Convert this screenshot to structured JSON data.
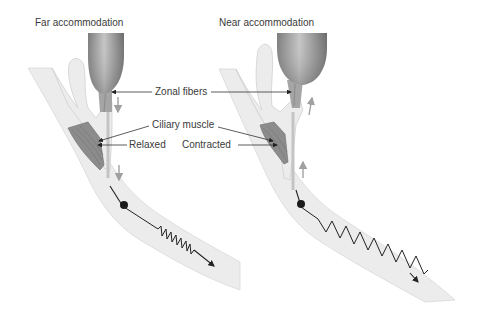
{
  "panels": {
    "far": {
      "title": "Far accommodation"
    },
    "near": {
      "title": "Near accommodation"
    }
  },
  "labels": {
    "zonal_fibers": "Zonal fibers",
    "ciliary_muscle": "Ciliary muscle",
    "relaxed": "Relaxed",
    "contracted": "Contracted"
  },
  "colors": {
    "background": "#ffffff",
    "tissue": "#ececec",
    "tissue_edge": "#d6d6d6",
    "lens_dark": "#6e6e6e",
    "lens_light": "#b8b8b8",
    "muscle": "#8a8a8a",
    "fiber": "#a9a9a9",
    "arrow_gray": "#a0a0a0",
    "leader": "#333333"
  }
}
